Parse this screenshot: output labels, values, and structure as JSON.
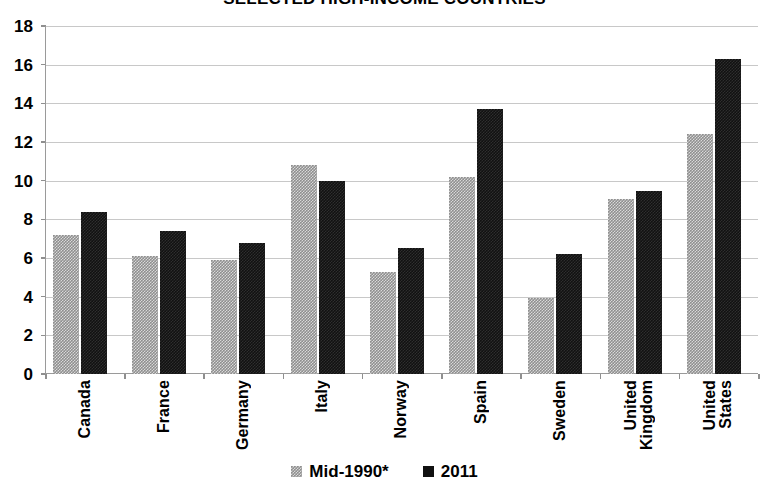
{
  "chart_data": {
    "type": "bar",
    "title": "SELECTED HIGH-INCOME COUNTRIES",
    "subtitle": "",
    "xlabel": "",
    "ylabel": "",
    "ylim": [
      0,
      18
    ],
    "ytick_step": 2,
    "ytick_labels": [
      "18",
      "16",
      "14",
      "12",
      "10",
      "8",
      "6",
      "4",
      "2",
      "0"
    ],
    "grid": true,
    "legend_position": "bottom",
    "categories": [
      "Canada",
      "France",
      "Germany",
      "Italy",
      "Norway",
      "Spain",
      "Sweden",
      "United Kingdom",
      "United States"
    ],
    "category_lines": [
      [
        "Canada"
      ],
      [
        "France"
      ],
      [
        "Germany"
      ],
      [
        "Italy"
      ],
      [
        "Norway"
      ],
      [
        "Spain"
      ],
      [
        "Sweden"
      ],
      [
        "United",
        "Kingdom"
      ],
      [
        "United",
        "States"
      ]
    ],
    "series": [
      {
        "name": "Mid-1990*",
        "color": "#8f8f8f",
        "values": [
          7.2,
          6.1,
          5.9,
          10.8,
          5.3,
          10.2,
          3.95,
          9.05,
          12.4
        ]
      },
      {
        "name": "2011",
        "color": "#111111",
        "values": [
          8.4,
          7.4,
          6.8,
          10.0,
          6.5,
          13.7,
          6.2,
          9.45,
          16.3
        ]
      }
    ]
  },
  "legend": {
    "items": [
      {
        "label": "Mid-1990*",
        "swatch": "mid1990-swatch-icon"
      },
      {
        "label": "2011",
        "swatch": "y2011-swatch-icon"
      }
    ]
  }
}
